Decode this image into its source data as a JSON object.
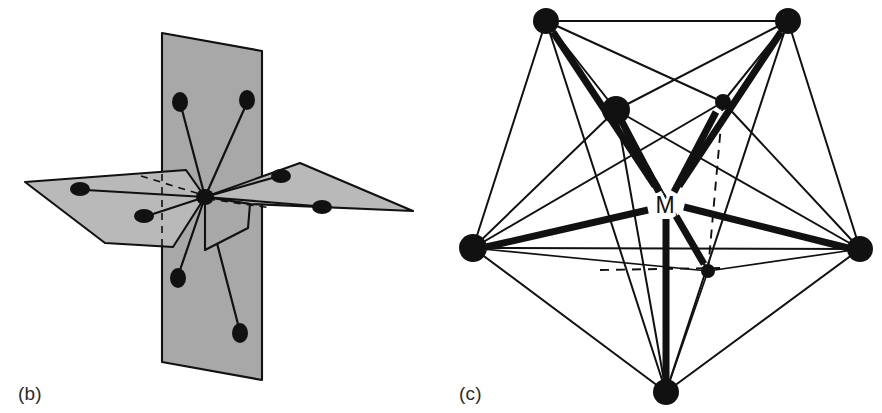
{
  "figure": {
    "background_color": "#ffffff",
    "ink_color": "#111111",
    "plane_fill_color": "#a8a8a8",
    "plane_fill_color_light": "#b9b9b9",
    "width": 882,
    "height": 413
  },
  "panels": [
    {
      "id": "b",
      "caption": "(b)",
      "name": "pentagonal-bipyramid-planes",
      "description": "Two intersecting shaded planes with eight ligand atoms bonded to a central atom",
      "center_atom": {
        "cx": 205,
        "cy": 197,
        "rx": 9,
        "ry": 8
      },
      "planes": [
        {
          "name": "vertical-plane",
          "fill": "#a8a8a8",
          "points": "162,33 262,51 262,380 162,362"
        },
        {
          "name": "horizontal-plane-left",
          "fill": "#b9b9b9",
          "points": "25,182 205,197 170,243 105,243"
        },
        {
          "name": "horizontal-plane-right",
          "fill": "#b9b9b9",
          "points": "205,197 300,163 410,210 250,202"
        }
      ],
      "ligands": [
        {
          "name": "ligand-top-left",
          "cx": 180,
          "cy": 102,
          "rx": 8,
          "ry": 10
        },
        {
          "name": "ligand-top-right",
          "cx": 247,
          "cy": 100,
          "rx": 8,
          "ry": 10
        },
        {
          "name": "ligand-bottom-left",
          "cx": 178,
          "cy": 278,
          "rx": 8,
          "ry": 10
        },
        {
          "name": "ligand-bottom-right",
          "cx": 240,
          "cy": 333,
          "rx": 8,
          "ry": 10
        },
        {
          "name": "ligand-left-far",
          "cx": 80,
          "cy": 189,
          "rx": 10,
          "ry": 7
        },
        {
          "name": "ligand-left-near",
          "cx": 144,
          "cy": 216,
          "rx": 10,
          "ry": 7
        },
        {
          "name": "ligand-right-near",
          "cx": 281,
          "cy": 176,
          "rx": 10,
          "ry": 7
        },
        {
          "name": "ligand-right-far",
          "cx": 322,
          "cy": 207,
          "rx": 10,
          "ry": 7
        }
      ],
      "dashed_guides": [
        {
          "name": "hidden-axis-left",
          "d": "M 141 176 L 205 197"
        },
        {
          "name": "hidden-axis-right",
          "d": "M 205 197 L 272 206"
        },
        {
          "name": "hidden-axis-down",
          "d": "M 162 175 L 162 246"
        }
      ]
    },
    {
      "id": "c",
      "caption": "(c)",
      "name": "capped-polyhedron-metal-center",
      "description": "Seven-vertex polyhedron with bold bonds from central metal atom M",
      "metal_label": "M",
      "metal_center": {
        "cx": 665,
        "cy": 205
      },
      "vertices": [
        {
          "name": "vertex-top-left",
          "cx": 546,
          "cy": 21,
          "r": 13
        },
        {
          "name": "vertex-top-right",
          "cx": 788,
          "cy": 21,
          "r": 13
        },
        {
          "name": "vertex-inner-left",
          "cx": 616,
          "cy": 110,
          "r": 14
        },
        {
          "name": "vertex-inner-right",
          "cx": 723,
          "cy": 102,
          "r": 8
        },
        {
          "name": "vertex-left",
          "cx": 473,
          "cy": 248,
          "r": 14
        },
        {
          "name": "vertex-right",
          "cx": 860,
          "cy": 249,
          "r": 13
        },
        {
          "name": "vertex-inner-bottom",
          "cx": 708,
          "cy": 271,
          "r": 7
        },
        {
          "name": "vertex-bottom",
          "cx": 666,
          "cy": 392,
          "r": 13
        }
      ]
    }
  ]
}
